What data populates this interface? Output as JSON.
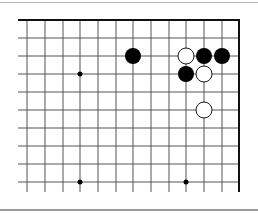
{
  "board": {
    "description": "Go board corner diagram (upper-right region)",
    "grid": {
      "columns_x": [
        27,
        45,
        63,
        80,
        98,
        116,
        133,
        151,
        169,
        186,
        204,
        222
      ],
      "right_edge_x": 239,
      "rows_y": [
        20,
        38,
        56,
        74,
        92,
        110,
        128,
        146,
        164,
        182
      ],
      "top_edge_y": 20,
      "left_extent_x": 18,
      "bottom_extent_y": 192,
      "line_color": "#555555",
      "edge_color": "#111111"
    },
    "star_points": [
      {
        "x": 80,
        "y": 74
      },
      {
        "x": 80,
        "y": 182
      },
      {
        "x": 186,
        "y": 182
      }
    ],
    "stones": [
      {
        "color": "black",
        "x": 133,
        "y": 56
      },
      {
        "color": "white",
        "x": 186,
        "y": 56
      },
      {
        "color": "black",
        "x": 204,
        "y": 56
      },
      {
        "color": "black",
        "x": 222,
        "y": 56
      },
      {
        "color": "black",
        "x": 186,
        "y": 74
      },
      {
        "color": "white",
        "x": 204,
        "y": 74
      },
      {
        "color": "white",
        "x": 204,
        "y": 110
      }
    ],
    "colors": {
      "black_stone": "#000000",
      "white_stone": "#ffffff",
      "white_stone_outline": "#000000",
      "background": "#ffffff"
    }
  }
}
